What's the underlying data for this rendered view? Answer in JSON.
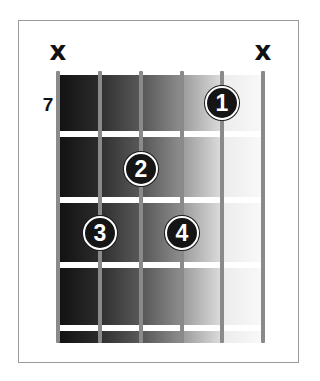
{
  "diagram": {
    "type": "guitar-chord-diagram",
    "starting_fret_label": "7",
    "muted_marker": "x",
    "strings": [
      {
        "index": 1,
        "x": 58,
        "state": "muted"
      },
      {
        "index": 2,
        "x": 100,
        "state": "fretted"
      },
      {
        "index": 3,
        "x": 141,
        "state": "fretted"
      },
      {
        "index": 4,
        "x": 182,
        "state": "fretted"
      },
      {
        "index": 5,
        "x": 222,
        "state": "fretted"
      },
      {
        "index": 6,
        "x": 263,
        "state": "muted"
      }
    ],
    "frets": [
      {
        "index": 1,
        "y": 131
      },
      {
        "index": 2,
        "y": 197
      },
      {
        "index": 3,
        "y": 262
      },
      {
        "index": 4,
        "y": 325
      }
    ],
    "fingers": [
      {
        "label": "1",
        "string": 5,
        "fret": 1,
        "x": 222,
        "y": 103
      },
      {
        "label": "2",
        "string": 3,
        "fret": 2,
        "x": 141,
        "y": 169
      },
      {
        "label": "3",
        "string": 2,
        "fret": 3,
        "x": 100,
        "y": 233
      },
      {
        "label": "4",
        "string": 4,
        "fret": 3,
        "x": 182,
        "y": 233
      }
    ],
    "colors": {
      "string": "#8a8a8a",
      "fret": "#ffffff",
      "finger_fill": "#151515",
      "finger_text": "#ffffff",
      "marker": "#111111",
      "frame_border": "#9a9a9a"
    },
    "gradient_columns": [
      {
        "left": 0,
        "width": 42,
        "from": "#111111",
        "to": "#2c2c2c"
      },
      {
        "left": 42,
        "width": 41,
        "from": "#2e2e2e",
        "to": "#5a5a5a"
      },
      {
        "left": 83,
        "width": 41,
        "from": "#555555",
        "to": "#8e8e8e"
      },
      {
        "left": 124,
        "width": 40,
        "from": "#9a9a9a",
        "to": "#dddddd"
      },
      {
        "left": 164,
        "width": 41,
        "from": "#ececec",
        "to": "#f9f9f9"
      }
    ]
  }
}
